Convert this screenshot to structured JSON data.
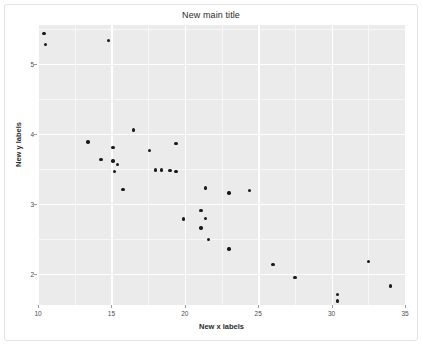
{
  "chart_data": {
    "type": "scatter",
    "title": "New main title",
    "xlabel": "New x labels",
    "ylabel": "New y labels",
    "xlim": [
      10,
      35
    ],
    "ylim": [
      1.55,
      5.55
    ],
    "xticks": [
      10,
      15,
      20,
      25,
      30,
      35
    ],
    "xtick_labels": [
      "10",
      "15",
      "20",
      "25",
      "30",
      "35"
    ],
    "yticks": [
      2,
      3,
      4,
      5
    ],
    "ytick_labels": [
      "2",
      "3",
      "4",
      "5"
    ],
    "grid": true,
    "legend": false,
    "panel_background": "#ebebeb",
    "grid_color": "#ffffff",
    "point_color": "#1a1a1a",
    "points": [
      {
        "x": 10.4,
        "y": 5.43
      },
      {
        "x": 10.5,
        "y": 5.27
      },
      {
        "x": 14.8,
        "y": 5.33
      },
      {
        "x": 16.5,
        "y": 4.05
      },
      {
        "x": 13.4,
        "y": 3.88
      },
      {
        "x": 19.4,
        "y": 3.86
      },
      {
        "x": 15.1,
        "y": 3.8
      },
      {
        "x": 17.6,
        "y": 3.76
      },
      {
        "x": 14.3,
        "y": 3.63
      },
      {
        "x": 15.1,
        "y": 3.61
      },
      {
        "x": 15.4,
        "y": 3.56
      },
      {
        "x": 15.2,
        "y": 3.46
      },
      {
        "x": 18.0,
        "y": 3.48
      },
      {
        "x": 18.4,
        "y": 3.48
      },
      {
        "x": 19.0,
        "y": 3.47
      },
      {
        "x": 19.4,
        "y": 3.46
      },
      {
        "x": 15.8,
        "y": 3.2
      },
      {
        "x": 21.4,
        "y": 3.22
      },
      {
        "x": 23.0,
        "y": 3.15
      },
      {
        "x": 24.4,
        "y": 3.19
      },
      {
        "x": 21.1,
        "y": 2.9
      },
      {
        "x": 21.4,
        "y": 2.79
      },
      {
        "x": 19.9,
        "y": 2.78
      },
      {
        "x": 21.1,
        "y": 2.65
      },
      {
        "x": 21.6,
        "y": 2.49
      },
      {
        "x": 23.0,
        "y": 2.35
      },
      {
        "x": 26.0,
        "y": 2.13
      },
      {
        "x": 32.5,
        "y": 2.17
      },
      {
        "x": 27.5,
        "y": 1.94
      },
      {
        "x": 34.0,
        "y": 1.82
      },
      {
        "x": 30.4,
        "y": 1.7
      },
      {
        "x": 30.4,
        "y": 1.61
      }
    ]
  }
}
